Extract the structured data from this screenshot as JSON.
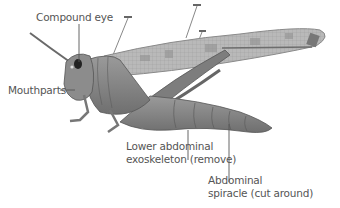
{
  "diagram": {
    "labels": {
      "compound_eye": "Compound eye",
      "mouthparts": "Mouthparts",
      "lower_abdominal_exoskeleton": "Lower abdominal\nexoskeleton (remove)",
      "abdominal_spiracle": "Abdominal\nspiracle (cut around)"
    },
    "colors": {
      "label_text": "#555555",
      "leader_line": "#555555",
      "body": "#8a8a8a",
      "wing": "#b5b5b5",
      "background": "#ffffff"
    }
  }
}
